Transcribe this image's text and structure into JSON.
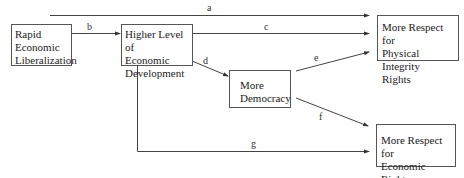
{
  "nodes": {
    "rel": {
      "lines": [
        "Rapid",
        "Economic",
        "Liberalization"
      ]
    },
    "dev": {
      "lines": [
        "Higher Level of",
        "Economic",
        "Development"
      ]
    },
    "dem": {
      "lines": [
        "More",
        "Democracy"
      ]
    },
    "pir": {
      "lines": [
        "More Respect for",
        "Physical Integrity",
        "Rights"
      ]
    },
    "er": {
      "lines": [
        "More Respect for",
        "Economic Rights"
      ]
    }
  },
  "edges": {
    "a": {
      "label": "a",
      "from": "Rapid Economic Liberalization",
      "to": "More Respect for Physical Integrity Rights"
    },
    "b": {
      "label": "b",
      "from": "Rapid Economic Liberalization",
      "to": "Higher Level of Economic Development"
    },
    "c": {
      "label": "c",
      "from": "Higher Level of Economic Development",
      "to": "More Respect for Physical Integrity Rights"
    },
    "d": {
      "label": "d",
      "from": "Higher Level of Economic Development",
      "to": "More Democracy"
    },
    "e": {
      "label": "e",
      "from": "More Democracy",
      "to": "More Respect for Physical Integrity Rights"
    },
    "f": {
      "label": "f",
      "from": "More Democracy",
      "to": "More Respect for Economic Rights"
    },
    "g": {
      "label": "g",
      "from": "Higher Level of Economic Development",
      "to": "More Respect for Economic Rights"
    }
  },
  "colors": {
    "line": "#444444",
    "border": "#555555",
    "text": "#222222"
  }
}
